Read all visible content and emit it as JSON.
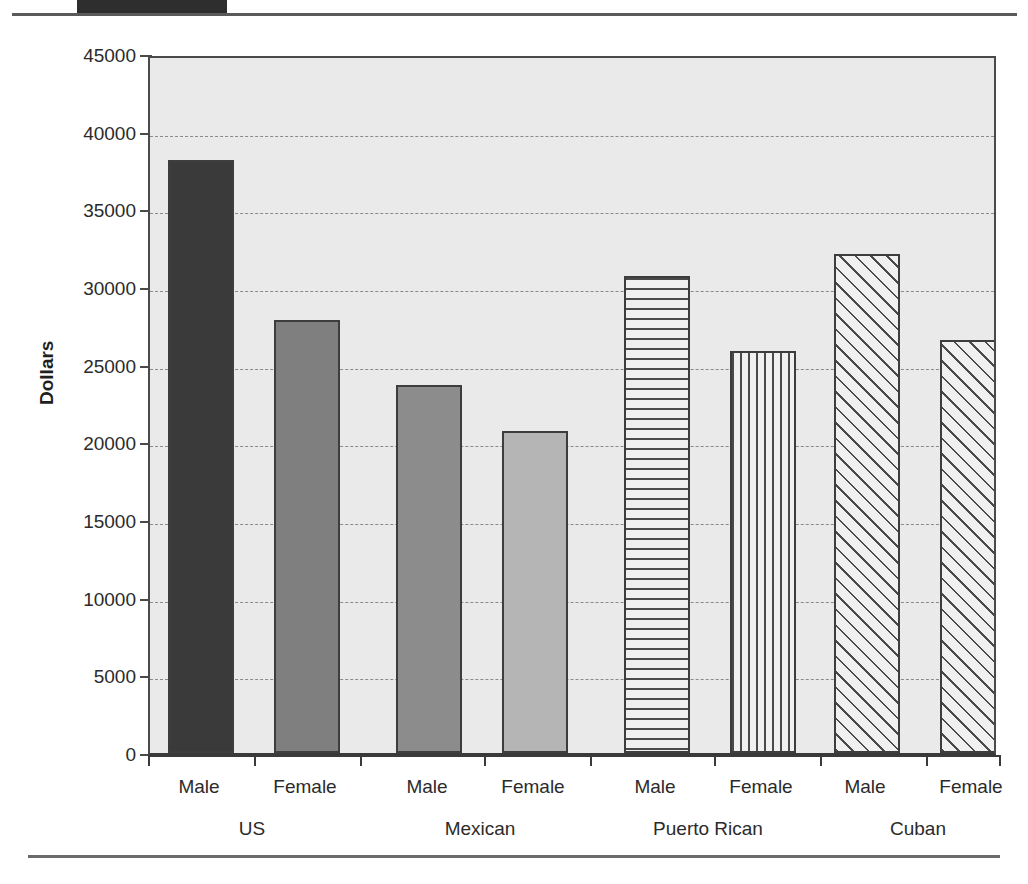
{
  "chart_data": {
    "type": "bar",
    "title": "",
    "xlabel": "",
    "ylabel": "Dollars",
    "ylim": [
      0,
      45000
    ],
    "ytick_labels": [
      "0",
      "5000",
      "10000",
      "15000",
      "20000",
      "25000",
      "30000",
      "35000",
      "40000",
      "45000"
    ],
    "ytick_values": [
      0,
      5000,
      10000,
      15000,
      20000,
      25000,
      30000,
      35000,
      40000,
      45000
    ],
    "grid": true,
    "legend": "none",
    "groups": [
      "US",
      "Mexican",
      "Puerto Rican",
      "Cuban"
    ],
    "categories": [
      "US Male",
      "US Female",
      "Mexican Male",
      "Mexican Female",
      "Puerto Rican Male",
      "Puerto Rican Female",
      "Cuban Male",
      "Cuban Female"
    ],
    "bar_labels": [
      "Male",
      "Female",
      "Male",
      "Female",
      "Male",
      "Female",
      "Male",
      "Female"
    ],
    "values": [
      38200,
      27900,
      23700,
      20700,
      30700,
      25900,
      32100,
      26600
    ],
    "bars": [
      {
        "group": "US",
        "sex": "Male",
        "value": 38200,
        "pattern": "solid-dark"
      },
      {
        "group": "US",
        "sex": "Female",
        "value": 27900,
        "pattern": "solid-medium"
      },
      {
        "group": "Mexican",
        "sex": "Male",
        "value": 23700,
        "pattern": "solid-mid"
      },
      {
        "group": "Mexican",
        "sex": "Female",
        "value": 20700,
        "pattern": "solid-light"
      },
      {
        "group": "Puerto Rican",
        "sex": "Male",
        "value": 30700,
        "pattern": "horizontal-hatch"
      },
      {
        "group": "Puerto Rican",
        "sex": "Female",
        "value": 25900,
        "pattern": "vertical-hatch"
      },
      {
        "group": "Cuban",
        "sex": "Male",
        "value": 32100,
        "pattern": "diagonal-hatch"
      },
      {
        "group": "Cuban",
        "sex": "Female",
        "value": 26600,
        "pattern": "diagonal-hatch"
      }
    ],
    "colors": {
      "solid-dark": "#3a3a3a",
      "solid-medium": "#7f7f7f",
      "solid-mid": "#8c8c8c",
      "solid-light": "#b5b5b5",
      "hatch-line": "#4a4a4a",
      "plot-background": "#eaeaea",
      "axis": "#3a3a3a",
      "gridline": "#8a8a8a",
      "header-block": "#2e2e2e"
    }
  }
}
